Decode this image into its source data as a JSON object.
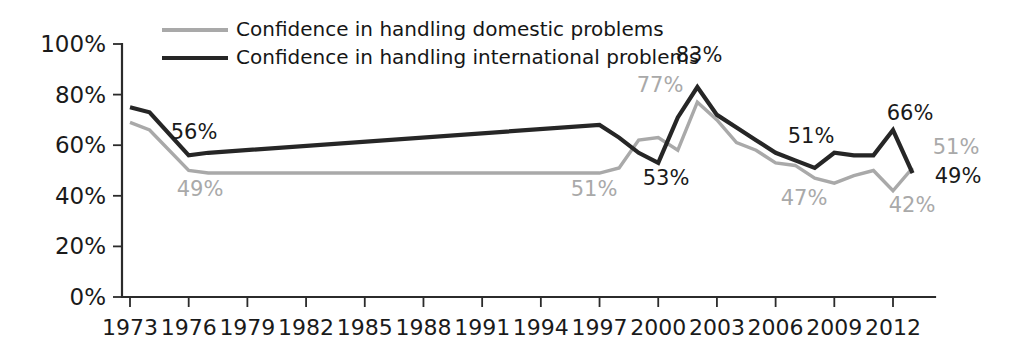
{
  "chart_data": {
    "type": "line",
    "title": "",
    "subtitle": "",
    "xlabel": "",
    "ylabel": "",
    "xlim": [
      1973,
      2013
    ],
    "ylim": [
      0,
      100
    ],
    "grid": false,
    "legend_position": "top-left",
    "y_ticks": [
      "0%",
      "20%",
      "40%",
      "60%",
      "80%",
      "100%"
    ],
    "y_tick_values": [
      0,
      20,
      40,
      60,
      80,
      100
    ],
    "x_ticks": [
      "1973",
      "1976",
      "1979",
      "1982",
      "1985",
      "1988",
      "1991",
      "1994",
      "1997",
      "2000",
      "2003",
      "2006",
      "2009",
      "2012"
    ],
    "x_tick_values": [
      1973,
      1976,
      1979,
      1982,
      1985,
      1988,
      1991,
      1994,
      1997,
      2000,
      2003,
      2006,
      2009,
      2012
    ],
    "series": [
      {
        "name": "Confidence in handling domestic problems",
        "key": "domestic",
        "color": "#a9a9a9",
        "stroke_width": 3.4,
        "x": [
          1973,
          1974,
          1976,
          1977,
          1997,
          1998,
          1999,
          2000,
          2001,
          2002,
          2003,
          2004,
          2005,
          2006,
          2007,
          2008,
          2009,
          2010,
          2011,
          2012,
          2013
        ],
        "values": [
          69,
          66,
          50,
          49,
          49,
          51,
          62,
          63,
          58,
          77,
          70,
          61,
          58,
          53,
          52,
          47,
          45,
          48,
          50,
          42,
          51
        ]
      },
      {
        "name": "Confidence in handling international problems",
        "key": "international",
        "color": "#262626",
        "stroke_width": 4.2,
        "x": [
          1973,
          1974,
          1976,
          1977,
          1997,
          1998,
          1999,
          2000,
          2001,
          2002,
          2003,
          2004,
          2005,
          2006,
          2007,
          2008,
          2009,
          2010,
          2011,
          2012,
          2013
        ],
        "values": [
          75,
          73,
          56,
          57,
          68,
          63,
          57,
          53,
          71,
          83,
          72,
          67,
          62,
          57,
          54,
          51,
          57,
          56,
          56,
          66,
          49
        ]
      }
    ],
    "annotations": [
      {
        "text": "56%",
        "series": "international",
        "x": 1976,
        "value": 56,
        "color": "#1a1a1a",
        "px": 194,
        "py": 139
      },
      {
        "text": "49%",
        "series": "domestic",
        "x": 1977,
        "value": 49,
        "color": "#a9a9a9",
        "px": 200,
        "py": 196
      },
      {
        "text": "51%",
        "series": "domestic",
        "x": 1998,
        "value": 51,
        "color": "#a9a9a9",
        "px": 594,
        "py": 196
      },
      {
        "text": "53%",
        "series": "international",
        "x": 2000,
        "value": 53,
        "color": "#1a1a1a",
        "px": 666,
        "py": 185
      },
      {
        "text": "77%",
        "series": "domestic",
        "x": 2002,
        "value": 77,
        "color": "#a9a9a9",
        "px": 660,
        "py": 92
      },
      {
        "text": "83%",
        "series": "international",
        "x": 2002,
        "value": 83,
        "color": "#1a1a1a",
        "px": 699,
        "py": 62
      },
      {
        "text": "51%",
        "series": "international",
        "x": 2007,
        "value": 54,
        "color": "#1a1a1a",
        "px": 811,
        "py": 143
      },
      {
        "text": "47%",
        "series": "domestic",
        "x": 2008,
        "value": 47,
        "color": "#a9a9a9",
        "px": 804,
        "py": 205
      },
      {
        "text": "66%",
        "series": "international",
        "x": 2012,
        "value": 66,
        "color": "#1a1a1a",
        "px": 910,
        "py": 120
      },
      {
        "text": "51%",
        "series": "domestic",
        "x": 2013,
        "value": 51,
        "color": "#a9a9a9",
        "px": 956,
        "py": 154
      },
      {
        "text": "49%",
        "series": "international",
        "x": 2013,
        "value": 49,
        "color": "#1a1a1a",
        "px": 958,
        "py": 183
      },
      {
        "text": "42%",
        "series": "domestic",
        "x": 2012,
        "value": 42,
        "color": "#a9a9a9",
        "px": 912,
        "py": 212
      }
    ]
  },
  "legend": {
    "items": [
      {
        "label": "Confidence in handling domestic problems",
        "color": "#a9a9a9"
      },
      {
        "label": "Confidence in handling international problems",
        "color": "#262626"
      }
    ]
  }
}
